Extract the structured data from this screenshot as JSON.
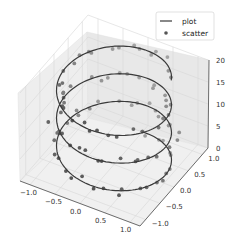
{
  "chart_data": {
    "type": "scatter",
    "projection": "3d",
    "title": "",
    "xlabel": "",
    "ylabel": "",
    "zlabel": "",
    "xlim": [
      -1.2,
      1.2
    ],
    "ylim": [
      -1.2,
      1.2
    ],
    "zlim": [
      0,
      20
    ],
    "x_ticks": [
      "−1.0",
      "−0.5",
      "0.0",
      "0.5",
      "1.0"
    ],
    "y_ticks": [
      "−1.0",
      "−0.5",
      "0.0",
      "0.5",
      "1.0"
    ],
    "z_ticks": [
      "0",
      "5",
      "10",
      "15",
      "20"
    ],
    "grid": true,
    "legend": {
      "position": "upper right",
      "entries": [
        {
          "label": "plot",
          "marker": "line"
        },
        {
          "label": "scatter",
          "marker": "dot"
        }
      ]
    },
    "series": [
      {
        "name": "plot",
        "kind": "line",
        "description": "helix: x = sin(z), y = cos(z), z from 0 to 20",
        "z_range": [
          0,
          20
        ],
        "turns": 3.2,
        "color": "#3a3a3a"
      },
      {
        "name": "scatter",
        "kind": "scatter",
        "description": "noisy points around helix, ~100 points",
        "count": 100,
        "noise": 0.1,
        "color": "#555555"
      }
    ]
  },
  "colors": {
    "pane": "#f2f2f2",
    "grid": "#d0d0d0",
    "line": "#3a3a3a",
    "scatter": "#555555"
  }
}
